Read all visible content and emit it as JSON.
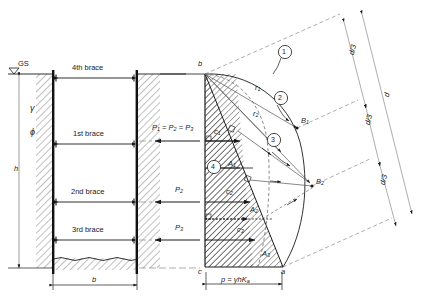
{
  "figure": {
    "type": "engineering-diagram"
  },
  "left_panel": {
    "ground_surface_label": "GS",
    "unit_weight_symbol": "γ",
    "friction_angle_symbol": "ϕ",
    "depth_symbol": "h",
    "width_symbol": "b",
    "braces": [
      {
        "label": "4th brace"
      },
      {
        "label": "1st brace"
      },
      {
        "label": "2nd brace"
      },
      {
        "label": "3rd brace"
      }
    ]
  },
  "right_panel": {
    "points": {
      "b": "b",
      "c": "c",
      "a": "a",
      "B1": "B",
      "B1_sub": "1",
      "B2": "B",
      "B2_sub": "2"
    },
    "radii": [
      {
        "symbol": "r",
        "sub": "1"
      },
      {
        "symbol": "r",
        "sub": "2"
      }
    ],
    "steps": [
      "1",
      "2",
      "3",
      "4"
    ],
    "forces": [
      {
        "symbol": "P",
        "sub": "1"
      },
      {
        "symbol": "P",
        "sub": "2"
      },
      {
        "symbol": "P",
        "sub": "3"
      }
    ],
    "force_equality": "P₁ = P₂ = P₃",
    "force_equality_parts": {
      "p": "P",
      "s1": "1",
      "eq": " = ",
      "s2": "2",
      "s3": "3"
    },
    "centroids": [
      {
        "symbol": "c",
        "sub": "1"
      },
      {
        "symbol": "c",
        "sub": "2"
      },
      {
        "symbol": "c",
        "sub": "3"
      }
    ],
    "areas": [
      {
        "symbol": "A",
        "sub": "1"
      },
      {
        "symbol": "A",
        "sub": "2"
      },
      {
        "symbol": "A",
        "sub": "3"
      }
    ],
    "dimensions": {
      "d": "d",
      "d_third": "d/3",
      "d_third_count": 3
    },
    "pressure_formula": "p = γhK",
    "pressure_formula_sub": "a"
  },
  "colors": {
    "ink": "#1a1a1a",
    "hatch": "#3a3a3a",
    "dash": "#6d6d6d",
    "thin": "#555555",
    "paper": "#ffffff"
  }
}
